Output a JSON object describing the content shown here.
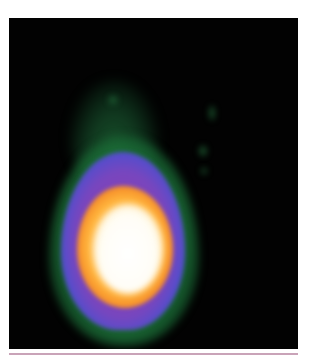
{
  "image": {
    "description": "False-color fluorescence micrograph of a single cell nucleus (comet-like shape) on black background",
    "background_color": "#020202",
    "colormap": [
      "#2a8c46",
      "#4650d2",
      "#9640aa",
      "#f07820",
      "#ffb43c",
      "#ffffff"
    ],
    "rule_color": "#c9a3b8"
  }
}
